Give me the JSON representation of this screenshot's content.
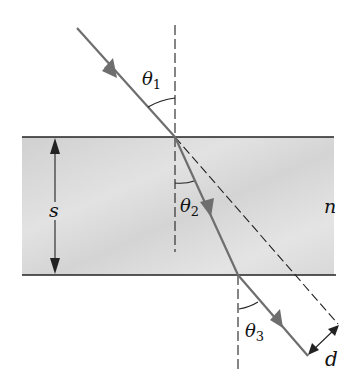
{
  "diagram": {
    "labels": {
      "theta1": {
        "symbol": "θ",
        "sub": "1"
      },
      "theta2": {
        "symbol": "θ",
        "sub": "2"
      },
      "theta3": {
        "symbol": "θ",
        "sub": "3"
      },
      "thickness": "s",
      "index": "n",
      "displacement": "d"
    },
    "colors": {
      "ray": "#6e6e6e",
      "slab_fill": "#d9d9d9",
      "line": "#222222",
      "background": "#ffffff"
    }
  }
}
